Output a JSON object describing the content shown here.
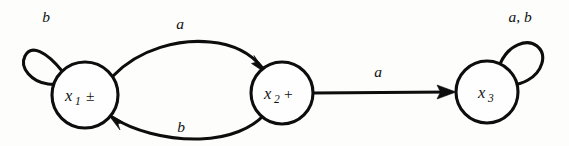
{
  "diagram": {
    "type": "state-transition-diagram",
    "background_color": "#fdfdfc",
    "ink_color": "#0d0d0d",
    "states": [
      {
        "id": "x1",
        "base_label": "x",
        "subscript": "1",
        "marker": "±",
        "full_label": "x₁ ±",
        "cx": 85,
        "cy": 95,
        "r": 33
      },
      {
        "id": "x2",
        "base_label": "x",
        "subscript": "2",
        "marker": "+",
        "full_label": "x₂ +",
        "cx": 282,
        "cy": 93,
        "r": 31
      },
      {
        "id": "x3",
        "base_label": "x",
        "subscript": "3",
        "marker": "",
        "full_label": "x₃",
        "cx": 487,
        "cy": 92,
        "r": 31
      }
    ],
    "transitions": [
      {
        "id": "t-x1-x1",
        "from": "x1",
        "to": "x1",
        "label": "b",
        "shape": "self-loop",
        "label_x": 46,
        "label_y": 22
      },
      {
        "id": "t-x1-x2",
        "from": "x1",
        "to": "x2",
        "label": "a",
        "shape": "curve-upper",
        "label_x": 180,
        "label_y": 29
      },
      {
        "id": "t-x2-x1",
        "from": "x2",
        "to": "x1",
        "label": "b",
        "shape": "curve-lower",
        "label_x": 181,
        "label_y": 132
      },
      {
        "id": "t-x2-x3",
        "from": "x2",
        "to": "x3",
        "label": "a",
        "shape": "straight",
        "label_x": 378,
        "label_y": 77
      },
      {
        "id": "t-x3-x3",
        "from": "x3",
        "to": "x3",
        "label": "a, b",
        "shape": "self-loop",
        "label_x": 520,
        "label_y": 22
      }
    ]
  }
}
